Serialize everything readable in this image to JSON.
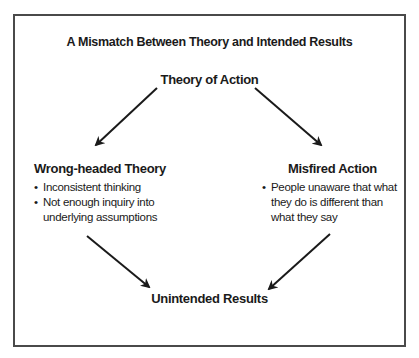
{
  "title": "A Mismatch Between Theory and Intended Results",
  "nodes": {
    "top": {
      "label": "Theory of Action"
    },
    "left": {
      "label": "Wrong-headed Theory",
      "bullets": [
        "Inconsistent thinking",
        "Not enough inquiry into",
        "underlying assumptions"
      ]
    },
    "right": {
      "label": "Misfired Action",
      "bullets": [
        "People unaware that what",
        "they do is different than",
        "what they say"
      ]
    },
    "bottom": {
      "label": "Unintended Results"
    }
  },
  "bullet_glyph": "•",
  "edges": [
    {
      "from": "Theory of Action",
      "to": "Wrong-headed Theory"
    },
    {
      "from": "Theory of Action",
      "to": "Misfired Action"
    },
    {
      "from": "Wrong-headed Theory",
      "to": "Unintended Results"
    },
    {
      "from": "Misfired Action",
      "to": "Unintended Results"
    }
  ],
  "colors": {
    "border": "#4a4a4a",
    "text": "#1a1a1a",
    "arrow": "#1a1a1a",
    "background": "#ffffff"
  }
}
